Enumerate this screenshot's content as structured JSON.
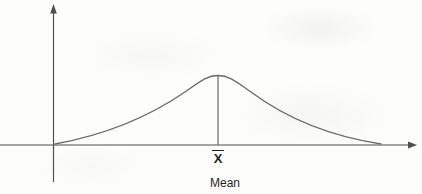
{
  "figure": {
    "type": "normal-distribution-bell-curve",
    "mean_symbol": "X",
    "caption": "Mean"
  },
  "colors": {
    "axis": "#4f4f4f",
    "curve": "#6a6a6a",
    "text": "#1f1f1f",
    "background": "#fdfdfc"
  }
}
